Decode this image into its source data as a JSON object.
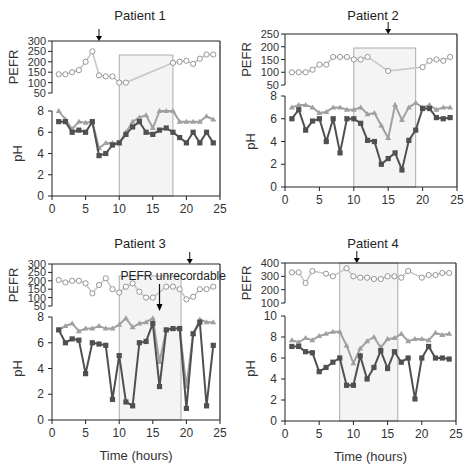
{
  "figure": {
    "xlabel": "Time (hours)",
    "colors": {
      "pefr_line": "#c8c8c8",
      "pefr_marker": "#8a8a8a",
      "ph_light": "#a0a0a0",
      "ph_dark": "#505050",
      "shade": "#f4f4f4",
      "axis": "#222222"
    }
  },
  "chart_data": [
    {
      "type": "line",
      "title": "Patient 1",
      "xlabel": "",
      "x_ticks": [
        0,
        5,
        10,
        15,
        20,
        25
      ],
      "xlim": [
        0,
        25
      ],
      "pefr": {
        "ylabel": "PEFR",
        "yticks": [
          50,
          100,
          150,
          200,
          250,
          300
        ],
        "ylim": [
          50,
          300
        ],
        "x": [
          1,
          2,
          3,
          4,
          5,
          6,
          7,
          8,
          9,
          10,
          11,
          18,
          19,
          20,
          21,
          22,
          23,
          24
        ],
        "values": [
          140,
          140,
          150,
          160,
          200,
          250,
          135,
          130,
          130,
          100,
          100,
          195,
          200,
          205,
          190,
          215,
          235,
          235
        ]
      },
      "ph": {
        "ylabel": "pH",
        "yticks": [
          0,
          2,
          4,
          6,
          8
        ],
        "ylim": [
          0,
          8
        ],
        "x": [
          1,
          2,
          3,
          4,
          5,
          6,
          7,
          8,
          9,
          10,
          11,
          12,
          13,
          14,
          15,
          16,
          17,
          18,
          19,
          20,
          21,
          22,
          23,
          24
        ],
        "series": [
          {
            "name": "pH (light)",
            "values": [
              8.0,
              7.2,
              6.3,
              7.0,
              6.9,
              7.0,
              4.5,
              5.0,
              5.0,
              5.0,
              6.0,
              7.0,
              7.4,
              7.6,
              6.4,
              8.0,
              8.0,
              8.0,
              7.0,
              7.0,
              7.0,
              7.0,
              7.5,
              7.2
            ]
          },
          {
            "name": "pH (dark)",
            "values": [
              7.0,
              7.0,
              6.0,
              6.2,
              6.0,
              7.0,
              3.8,
              4.0,
              4.8,
              5.0,
              5.8,
              6.5,
              7.0,
              6.0,
              5.8,
              6.2,
              6.4,
              6.0,
              5.5,
              5.0,
              6.0,
              5.0,
              6.0,
              5.0
            ]
          }
        ]
      },
      "shaded_region": [
        10,
        18
      ],
      "arrow_x": 7,
      "annotation": ""
    },
    {
      "type": "line",
      "title": "Patient 2",
      "xlabel": "",
      "x_ticks": [
        0,
        5,
        10,
        15,
        20,
        25
      ],
      "xlim": [
        0,
        25
      ],
      "pefr": {
        "ylabel": "PEFR",
        "yticks": [
          50,
          100,
          150,
          200,
          250
        ],
        "ylim": [
          50,
          250
        ],
        "x": [
          1,
          2,
          3,
          4,
          5,
          6,
          7,
          8,
          9,
          10,
          11,
          12,
          15,
          20,
          21,
          22,
          23,
          24
        ],
        "values": [
          100,
          100,
          100,
          110,
          130,
          130,
          160,
          160,
          160,
          150,
          150,
          160,
          105,
          120,
          145,
          150,
          145,
          160
        ]
      },
      "ph": {
        "ylabel": "pH",
        "yticks": [
          0,
          2,
          4,
          6,
          8
        ],
        "ylim": [
          0,
          8
        ],
        "x": [
          1,
          2,
          3,
          4,
          5,
          6,
          7,
          8,
          9,
          10,
          11,
          12,
          13,
          14,
          15,
          16,
          17,
          18,
          19,
          20,
          21,
          22,
          23,
          24
        ],
        "series": [
          {
            "name": "pH (light)",
            "values": [
              7.0,
              7.2,
              7.2,
              7.0,
              6.5,
              6.6,
              7.0,
              7.0,
              6.8,
              6.8,
              7.0,
              6.4,
              6.5,
              5.4,
              4.3,
              7.2,
              5.9,
              7.0,
              7.4,
              7.0,
              7.2,
              6.8,
              7.0,
              7.0
            ]
          },
          {
            "name": "pH (dark)",
            "values": [
              6.0,
              6.8,
              5.0,
              5.8,
              6.0,
              4.0,
              6.0,
              3.0,
              6.0,
              6.0,
              5.6,
              4.1,
              4.0,
              2.0,
              2.5,
              3.0,
              1.5,
              4.1,
              5.0,
              6.9,
              6.9,
              6.1,
              6.0,
              6.1
            ]
          }
        ]
      },
      "shaded_region": [
        10,
        19
      ],
      "arrow_x": 15,
      "annotation": ""
    },
    {
      "type": "line",
      "title": "Patient 3",
      "xlabel": "Time (hours)",
      "x_ticks": [
        0,
        5,
        10,
        15,
        20,
        25
      ],
      "xlim": [
        0,
        25
      ],
      "pefr": {
        "ylabel": "PEFR",
        "yticks": [
          50,
          100,
          150,
          200,
          250,
          300
        ],
        "ylim": [
          50,
          300
        ],
        "x": [
          1,
          2,
          3,
          4,
          5,
          6,
          7,
          8,
          9,
          10,
          11,
          12,
          13,
          14,
          15,
          17,
          18,
          19,
          20,
          21,
          22,
          23,
          24
        ],
        "values": [
          205,
          190,
          200,
          200,
          185,
          125,
          175,
          215,
          150,
          130,
          165,
          185,
          135,
          100,
          100,
          165,
          165,
          150,
          90,
          105,
          150,
          150,
          165
        ]
      },
      "ph": {
        "ylabel": "pH",
        "yticks": [
          0,
          2,
          4,
          6,
          8
        ],
        "ylim": [
          0,
          8
        ],
        "x": [
          1,
          2,
          3,
          4,
          5,
          6,
          7,
          8,
          9,
          10,
          11,
          12,
          13,
          14,
          15,
          16,
          17,
          18,
          19,
          20,
          21,
          22,
          23,
          24
        ],
        "series": [
          {
            "name": "pH (light)",
            "values": [
              7.0,
              7.3,
              7.5,
              6.9,
              7.1,
              7.1,
              7.3,
              7.1,
              7.1,
              7.4,
              7.9,
              7.2,
              7.5,
              7.6,
              7.9,
              4.5,
              7.0,
              7.1,
              7.1,
              2.6,
              6.7,
              7.8,
              7.6,
              7.6
            ]
          },
          {
            "name": "pH (dark)",
            "values": [
              7.0,
              6.0,
              6.3,
              6.2,
              3.6,
              6.0,
              5.9,
              5.8,
              1.6,
              5.0,
              1.4,
              1.1,
              6.0,
              6.1,
              7.5,
              2.6,
              7.0,
              7.1,
              7.1,
              0.9,
              6.7,
              7.6,
              1.1,
              5.8
            ]
          }
        ]
      },
      "shaded_region": [
        10,
        19.2
      ],
      "arrow_x": 20.5,
      "annotation": "PEFR unrecordable",
      "annotation_arrow_x": 16
    },
    {
      "type": "line",
      "title": "Patient 4",
      "xlabel": "Time (hours)",
      "x_ticks": [
        0,
        5,
        10,
        15,
        20,
        25
      ],
      "xlim": [
        0,
        25
      ],
      "pefr": {
        "ylabel": "PEFR",
        "yticks": [
          100,
          200,
          300,
          400
        ],
        "ylim": [
          100,
          400
        ],
        "x": [
          1,
          2,
          3,
          4,
          6,
          7,
          9,
          10,
          11,
          12,
          13,
          14,
          15,
          16,
          17,
          18,
          20,
          21,
          22,
          23,
          24
        ],
        "values": [
          330,
          330,
          250,
          340,
          320,
          300,
          360,
          300,
          290,
          290,
          280,
          280,
          300,
          300,
          290,
          340,
          290,
          310,
          310,
          325,
          325
        ]
      },
      "ph": {
        "ylabel": "pH",
        "yticks": [
          0,
          2,
          4,
          6,
          8,
          10
        ],
        "ylim": [
          0,
          10
        ],
        "x": [
          1,
          2,
          3,
          4,
          5,
          6,
          7,
          8,
          9,
          10,
          11,
          12,
          13,
          14,
          15,
          16,
          17,
          18,
          19,
          20,
          21,
          22,
          23,
          24
        ],
        "series": [
          {
            "name": "pH (light)",
            "values": [
              7.7,
              7.5,
              7.9,
              7.7,
              8.1,
              8.3,
              8.5,
              8.5,
              7.2,
              5.5,
              6.9,
              7.6,
              8.0,
              7.0,
              7.8,
              7.9,
              8.3,
              7.6,
              7.8,
              7.8,
              7.7,
              8.4,
              8.2,
              8.3
            ]
          },
          {
            "name": "pH (dark)",
            "values": [
              7.1,
              7.1,
              6.6,
              6.5,
              4.7,
              5.1,
              5.6,
              6.0,
              3.4,
              3.4,
              6.2,
              4.0,
              5.1,
              6.7,
              5.0,
              6.6,
              5.6,
              6.0,
              2.1,
              6.0,
              7.1,
              6.0,
              6.0,
              5.9
            ]
          }
        ]
      },
      "shaded_region": [
        8,
        16.5
      ],
      "arrow_x": 10.5,
      "annotation": ""
    }
  ],
  "layout": {
    "panels": [
      {
        "left": 52,
        "right": 220,
        "pefr_top": 41,
        "pefr_bottom": 93,
        "ph_top": 111,
        "ph_bottom": 196,
        "frame_top": 41,
        "title_y": 8,
        "shade_top": 55
      },
      {
        "left": 285,
        "right": 457,
        "pefr_top": 34,
        "pefr_bottom": 85,
        "ph_top": 96,
        "ph_bottom": 187,
        "frame_top": 34,
        "title_y": 8,
        "shade_top": 48
      },
      {
        "left": 52,
        "right": 220,
        "pefr_top": 264,
        "pefr_bottom": 306,
        "ph_top": 317,
        "ph_bottom": 420,
        "frame_top": 264,
        "title_y": 236,
        "shade_top": 276
      },
      {
        "left": 285,
        "right": 456,
        "pefr_top": 263,
        "pefr_bottom": 303,
        "ph_top": 316,
        "ph_bottom": 421,
        "frame_top": 263,
        "title_y": 236,
        "shade_top": 263
      }
    ]
  }
}
